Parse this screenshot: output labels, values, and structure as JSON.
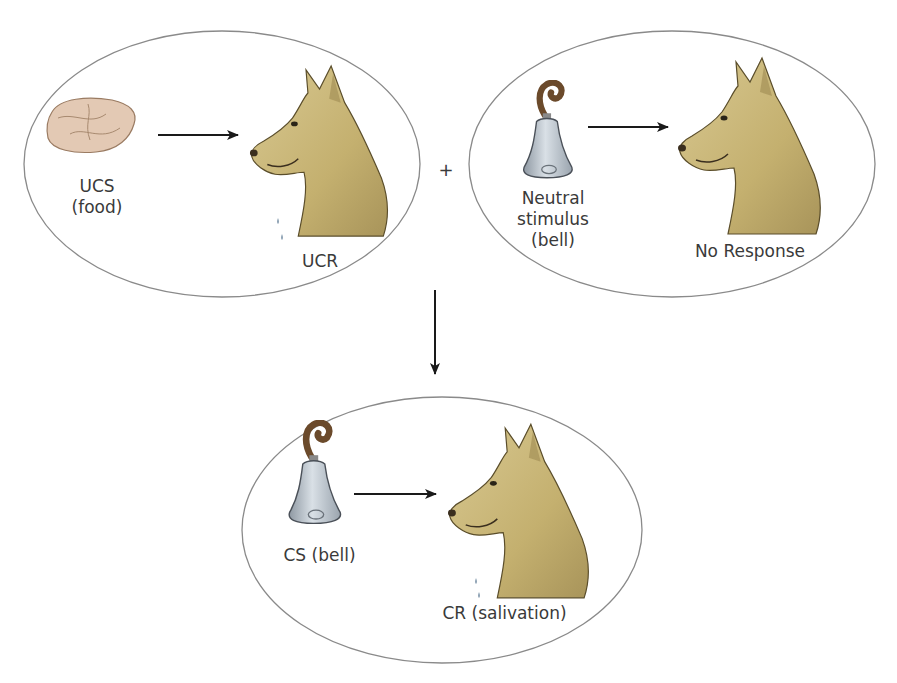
{
  "diagram": {
    "panels": [
      {
        "id": "before-food",
        "stimulus_icon": "food-icon",
        "stimulus_label_line1": "UCS",
        "stimulus_label_line2": "(food)",
        "response_icon": "salivating-dog-icon",
        "response_label": "UCR"
      },
      {
        "id": "before-bell",
        "stimulus_icon": "bell-icon",
        "stimulus_label_line1": "Neutral",
        "stimulus_label_line2": "stimulus",
        "stimulus_label_line3": "(bell)",
        "response_icon": "dog-icon",
        "response_label": "No Response"
      },
      {
        "id": "after-conditioning",
        "stimulus_icon": "bell-icon",
        "stimulus_label_line1": "CS (bell)",
        "response_icon": "salivating-dog-icon",
        "response_label": "CR (salivation)"
      }
    ],
    "plus_sign": "+",
    "colors": {
      "ellipse_stroke": "#8a8a8a",
      "dog_fur": "#c9b77a",
      "bell": "#b9c3cc",
      "bell_handle": "#6b4a2b",
      "food": "#d9b9a0",
      "arrow": "#1a1a1a",
      "label_text": "#3a3a3a"
    }
  }
}
